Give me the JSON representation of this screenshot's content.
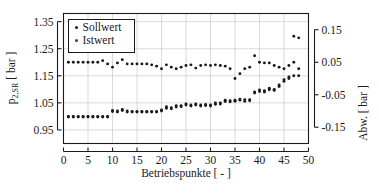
{
  "chart_data": {
    "type": "scatter",
    "title": "",
    "xlabel": "Betriebspunkte [ - ]",
    "ylabel_left": "p2,SR [ bar ]",
    "ylabel_left_main": "p",
    "ylabel_left_sub": "2,SR",
    "ylabel_left_unit": "[ bar ]",
    "ylabel_right": "Abw. [ bar ]",
    "xlim": [
      0,
      50
    ],
    "ylim_left": [
      0.9,
      1.38
    ],
    "ylim_right": [
      -0.2,
      0.2
    ],
    "xticks": [
      0,
      5,
      10,
      15,
      20,
      25,
      30,
      35,
      40,
      45,
      50
    ],
    "xticklabels": [
      "0",
      "5",
      "10",
      "15",
      "20",
      "25",
      "30",
      "35",
      "40",
      "45",
      "50"
    ],
    "yticks_left": [
      0.95,
      1.05,
      1.15,
      1.25,
      1.35
    ],
    "yticklabels_left": [
      "0.95",
      "1.05",
      "1.15",
      "1.25",
      "1.35"
    ],
    "yticks_right": [
      -0.15,
      -0.05,
      0.05,
      0.15
    ],
    "yticklabels_right": [
      "-0.15",
      "-0.05",
      "0.05",
      "0.15"
    ],
    "grid": true,
    "grid_color": "#c8c8d2",
    "legend_position": "upper-left",
    "legend_entries": [
      {
        "label": "Sollwert",
        "marker": "dot",
        "color": "#141414"
      },
      {
        "label": "Istwert",
        "marker": "dot",
        "color": "#3c3c50"
      }
    ],
    "marker_color": "#1a1a1a",
    "series": [
      {
        "name": "Sollwert",
        "axis": "left",
        "x": [
          1,
          2,
          3,
          4,
          5,
          6,
          7,
          8,
          9,
          10,
          11,
          12,
          13,
          14,
          15,
          16,
          17,
          18,
          19,
          20,
          21,
          22,
          23,
          24,
          25,
          26,
          27,
          28,
          29,
          30,
          31,
          32,
          33,
          34,
          35,
          36,
          37,
          38,
          39,
          40,
          41,
          42,
          43,
          44,
          45,
          46,
          47,
          48
        ],
        "y": [
          1.0,
          1.0,
          1.0,
          1.0,
          1.0,
          1.0,
          1.0,
          1.0,
          1.0,
          1.018,
          1.02,
          1.022,
          1.02,
          1.018,
          1.018,
          1.018,
          1.018,
          1.018,
          1.018,
          1.02,
          1.03,
          1.032,
          1.035,
          1.04,
          1.042,
          1.042,
          1.042,
          1.042,
          1.04,
          1.042,
          1.045,
          1.05,
          1.055,
          1.058,
          1.06,
          1.06,
          1.062,
          1.058,
          1.09,
          1.092,
          1.095,
          1.098,
          1.1,
          1.11,
          1.13,
          1.14,
          1.15,
          1.15
        ]
      },
      {
        "name": "Istwert",
        "axis": "left",
        "x": [
          1,
          2,
          3,
          4,
          5,
          6,
          7,
          8,
          9,
          10,
          11,
          12,
          13,
          14,
          15,
          16,
          17,
          18,
          19,
          20,
          21,
          22,
          23,
          24,
          25,
          26,
          27,
          28,
          29,
          30,
          31,
          32,
          33,
          34,
          35,
          36,
          37,
          38,
          39,
          40,
          41,
          42,
          43,
          44,
          45,
          46,
          47,
          48
        ],
        "y": [
          0.998,
          0.998,
          0.998,
          0.998,
          0.998,
          0.998,
          0.998,
          0.998,
          0.998,
          1.022,
          1.016,
          1.026,
          1.016,
          1.016,
          1.016,
          1.016,
          1.016,
          1.016,
          1.016,
          1.024,
          1.036,
          1.028,
          1.04,
          1.036,
          1.046,
          1.038,
          1.046,
          1.038,
          1.044,
          1.038,
          1.05,
          1.046,
          1.06,
          1.054,
          1.056,
          1.064,
          1.056,
          1.062,
          1.086,
          1.098,
          1.09,
          1.104,
          1.096,
          1.116,
          1.136,
          1.146,
          1.296,
          1.29
        ]
      },
      {
        "name": "Abweichung",
        "axis": "right",
        "x": [
          1,
          2,
          3,
          4,
          5,
          6,
          7,
          8,
          9,
          10,
          11,
          12,
          13,
          14,
          15,
          16,
          17,
          18,
          19,
          20,
          21,
          22,
          23,
          24,
          25,
          26,
          27,
          28,
          29,
          30,
          31,
          32,
          33,
          34,
          35,
          36,
          37,
          38,
          39,
          40,
          41,
          42,
          43,
          44,
          45,
          46,
          47,
          48
        ],
        "y": [
          0.05,
          0.05,
          0.05,
          0.05,
          0.05,
          0.05,
          0.05,
          0.055,
          0.045,
          0.035,
          0.048,
          0.058,
          0.045,
          0.045,
          0.045,
          0.045,
          0.045,
          0.042,
          0.038,
          0.03,
          0.042,
          0.035,
          0.03,
          0.035,
          0.04,
          0.042,
          0.032,
          0.04,
          0.042,
          0.04,
          0.042,
          0.04,
          0.038,
          0.03,
          0.0,
          0.015,
          0.03,
          0.035,
          0.07,
          0.05,
          0.048,
          0.048,
          0.04,
          0.035,
          0.03,
          0.04,
          0.05,
          0.03
        ]
      }
    ]
  },
  "axes": {
    "left_title_main": "p",
    "left_title_sub": "2,SR",
    "left_title_unit": "[ bar ]",
    "right_title": "Abw. [ bar ]",
    "x_title": "Betriebspunkte [ - ]"
  }
}
